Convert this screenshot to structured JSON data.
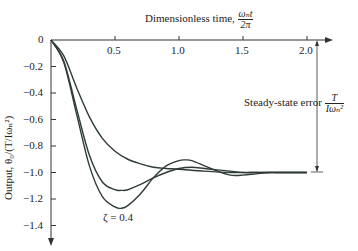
{
  "chart_data": {
    "type": "line",
    "title": "",
    "xlabel": "Dimensionless time, ωₙt / 2π",
    "xlabel_text": "Dimensionless time,",
    "xlabel_frac_num": "ωₙt",
    "xlabel_frac_den": "2π",
    "ylabel": "Output, θ₀/(T/Iωₙ²)",
    "xlim": [
      0,
      2.2
    ],
    "ylim": [
      -1.5,
      0
    ],
    "x_ticks": [
      "0.5",
      "1.0",
      "1.5",
      "2.0"
    ],
    "y_ticks": [
      "0",
      "-0.2",
      "-0.4",
      "-0.6",
      "-0.8",
      "-1.0",
      "-1.2",
      "-1.4"
    ],
    "grid": false,
    "annotation": {
      "text": "Steady-state error",
      "frac_num": "T",
      "frac_den": "Iωₙ²",
      "value": -1.0
    },
    "series": [
      {
        "name": "ζ = 0.4",
        "label": "ζ = 0.4",
        "x": [
          0,
          0.1,
          0.2,
          0.3,
          0.4,
          0.5,
          0.55,
          0.6,
          0.7,
          0.8,
          0.9,
          1.0,
          1.05,
          1.1,
          1.2,
          1.3,
          1.4,
          1.5,
          1.6,
          1.7,
          1.8,
          2.0
        ],
        "values": [
          0,
          -0.17,
          -0.56,
          -0.95,
          -1.18,
          -1.26,
          -1.27,
          -1.25,
          -1.16,
          -1.04,
          -0.95,
          -0.91,
          -0.905,
          -0.91,
          -0.95,
          -0.99,
          -1.02,
          -1.02,
          -1.01,
          -1.0,
          -1.0,
          -1.0
        ]
      },
      {
        "name": "ζ = 0.6",
        "label": "0.6",
        "x": [
          0,
          0.1,
          0.2,
          0.3,
          0.4,
          0.5,
          0.55,
          0.6,
          0.7,
          0.8,
          0.9,
          1.0,
          1.1,
          1.2,
          1.3,
          1.4,
          1.5,
          1.6,
          1.8,
          2.0
        ],
        "values": [
          0,
          -0.16,
          -0.52,
          -0.87,
          -1.07,
          -1.13,
          -1.135,
          -1.13,
          -1.09,
          -1.04,
          -1.0,
          -0.97,
          -0.96,
          -0.97,
          -0.98,
          -0.99,
          -1.0,
          -1.0,
          -1.0,
          -1.0
        ]
      },
      {
        "name": "ζ = 1.0",
        "label": "1.0",
        "x": [
          0,
          0.1,
          0.2,
          0.3,
          0.4,
          0.5,
          0.6,
          0.7,
          0.8,
          0.9,
          1.0,
          1.2,
          1.4,
          1.6,
          1.8,
          2.0
        ],
        "values": [
          0,
          -0.12,
          -0.36,
          -0.58,
          -0.74,
          -0.84,
          -0.9,
          -0.935,
          -0.96,
          -0.97,
          -0.975,
          -0.99,
          -1.0,
          -1.0,
          -1.0,
          -1.0
        ]
      }
    ],
    "legend": "inline curve labels"
  }
}
